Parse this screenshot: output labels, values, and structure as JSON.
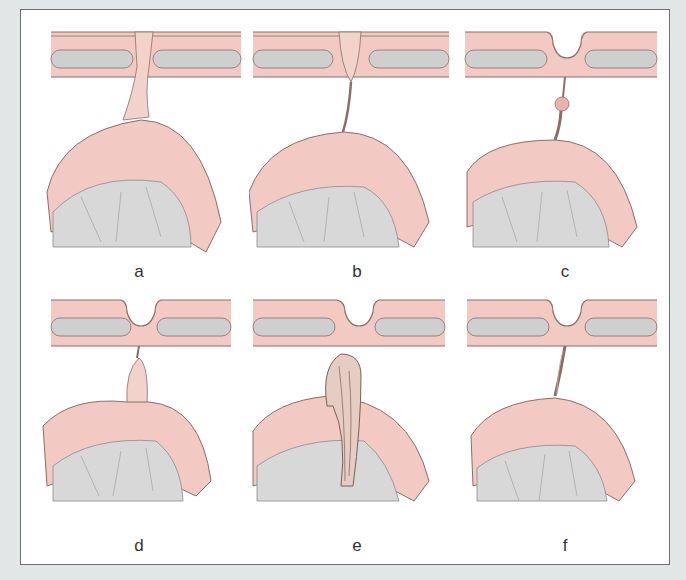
{
  "figure": {
    "background_color": "#e3e6e6",
    "panel_background": "#ffffff",
    "colors": {
      "tissue_pink": "#f2c9c3",
      "tissue_pink_light": "#f9e3df",
      "outline": "#8a6e6a",
      "grey_core": "#cfcfcf",
      "grey_mass": "#d8d8d8",
      "label": "#333333"
    },
    "panels": [
      {
        "label": "a",
        "variant": "wide-stalk"
      },
      {
        "label": "b",
        "variant": "thin-stalk-plug"
      },
      {
        "label": "c",
        "variant": "stalk-with-nodule"
      },
      {
        "label": "d",
        "variant": "short-stalk-bulge"
      },
      {
        "label": "e",
        "variant": "detached-elongated-mass"
      },
      {
        "label": "f",
        "variant": "twisted-thin-stalk"
      }
    ]
  }
}
